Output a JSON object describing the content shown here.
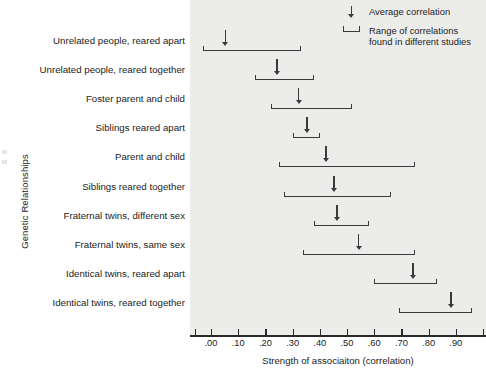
{
  "chart_data": {
    "type": "bar",
    "title": "",
    "xlabel": "Strength of associaiton (correlation)",
    "ylabel": "Genetic Relationships",
    "xlim": [
      -0.06,
      1.02
    ],
    "xticks": [
      0.0,
      0.1,
      0.2,
      0.3,
      0.4,
      0.5,
      0.6,
      0.7,
      0.8,
      0.9
    ],
    "xtick_labels": [
      ".00",
      ".10",
      ".20",
      ".30",
      ".40",
      ".50",
      ".60",
      ".70",
      ".80",
      ".90"
    ],
    "grid": false,
    "legend_position": "top-right",
    "categories": [
      "Unrelated people, reared apart",
      "Unrelated people, reared together",
      "Foster parent and child",
      "Siblings reared apart",
      "Parent and child",
      "Siblings reared together",
      "Fraternal twins, different sex",
      "Fraternal twins, same sex",
      "Identical twins, reared apart",
      "Identical twins, reared together"
    ],
    "series": [
      {
        "name": "Average correlation",
        "values": [
          0.05,
          0.24,
          0.32,
          0.35,
          0.42,
          0.45,
          0.46,
          0.54,
          0.74,
          0.88
        ]
      },
      {
        "name": "Range of correlations found in different studies",
        "range_low": [
          -0.03,
          0.16,
          0.22,
          0.3,
          0.25,
          0.27,
          0.38,
          0.34,
          0.6,
          0.69
        ],
        "range_high": [
          0.33,
          0.38,
          0.52,
          0.4,
          0.75,
          0.66,
          0.58,
          0.75,
          0.83,
          0.96
        ]
      }
    ],
    "rows": [
      {
        "label": "Unrelated people, reared apart",
        "avg": 0.05,
        "low": -0.03,
        "high": 0.33
      },
      {
        "label": "Unrelated people, reared together",
        "avg": 0.24,
        "low": 0.16,
        "high": 0.38
      },
      {
        "label": "Foster parent and child",
        "avg": 0.32,
        "low": 0.22,
        "high": 0.52
      },
      {
        "label": "Siblings reared apart",
        "avg": 0.35,
        "low": 0.3,
        "high": 0.4
      },
      {
        "label": "Parent and child",
        "avg": 0.42,
        "low": 0.25,
        "high": 0.75
      },
      {
        "label": "Siblings reared together",
        "avg": 0.45,
        "low": 0.27,
        "high": 0.66
      },
      {
        "label": "Fraternal twins, different sex",
        "avg": 0.46,
        "low": 0.38,
        "high": 0.58
      },
      {
        "label": "Fraternal twins, same sex",
        "avg": 0.54,
        "low": 0.34,
        "high": 0.75
      },
      {
        "label": "Identical twins, reared apart",
        "avg": 0.74,
        "low": 0.6,
        "high": 0.83
      },
      {
        "label": "Identical twins, reared together",
        "avg": 0.88,
        "low": 0.69,
        "high": 0.96
      }
    ]
  },
  "legend": {
    "items": [
      {
        "glyph": "down-arrow-icon",
        "label": "Average correlation"
      },
      {
        "glyph": "range-bracket-icon",
        "label": "Range of correlations found in different studies"
      }
    ]
  },
  "colors": {
    "mark": "#3a3a3a",
    "axis": "#2a2a2a",
    "panel_background": "#ececeb",
    "page_background": "#ffffff",
    "text": "#1c1c1c"
  }
}
